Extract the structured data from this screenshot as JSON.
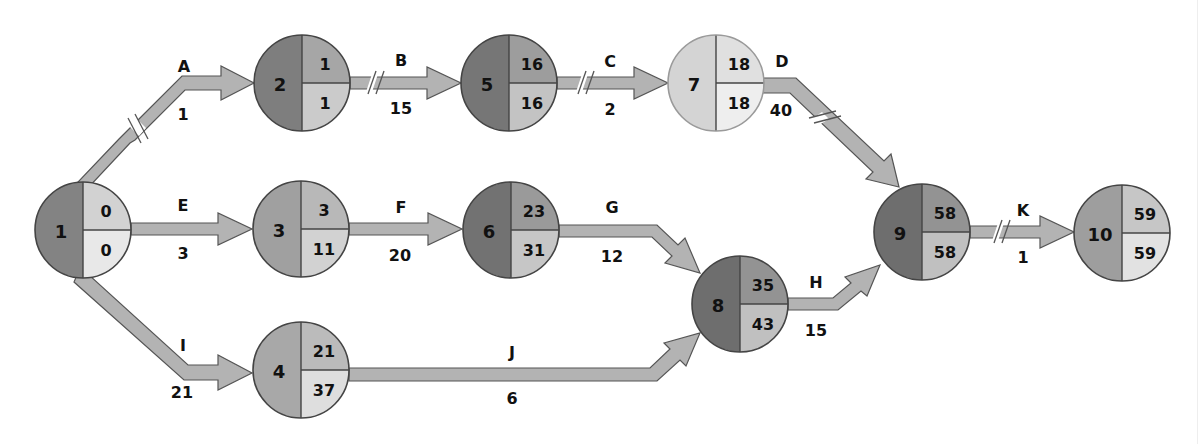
{
  "diagram": {
    "type": "network-diagram",
    "colors": {
      "arrow_fill": "#b3b3b3",
      "arrow_stroke": "#555555",
      "critical_dark": "#777777",
      "medium": "#9c9c9c",
      "light": "#c8c8c8",
      "very_light": "#e4e4e4",
      "background": "#ffffff"
    },
    "nodes": [
      {
        "id": "1",
        "earliest": "0",
        "latest": "0",
        "cx": 83,
        "cy": 230,
        "left": "#838383",
        "topright": "#d2d2d2",
        "bottomright": "#e8e8e8",
        "light_ring": false
      },
      {
        "id": "2",
        "earliest": "1",
        "latest": "1",
        "cx": 302,
        "cy": 83,
        "left": "#7e7e7e",
        "topright": "#a6a6a6",
        "bottomright": "#cbcbcb",
        "light_ring": false
      },
      {
        "id": "3",
        "earliest": "3",
        "latest": "11",
        "cx": 301,
        "cy": 229,
        "left": "#a0a0a0",
        "topright": "#b8b8b8",
        "bottomright": "#d2d2d2",
        "light_ring": false
      },
      {
        "id": "4",
        "earliest": "21",
        "latest": "37",
        "cx": 301,
        "cy": 370,
        "left": "#a8a8a8",
        "topright": "#bbbbbb",
        "bottomright": "#dedede",
        "light_ring": false
      },
      {
        "id": "5",
        "earliest": "16",
        "latest": "16",
        "cx": 509,
        "cy": 83,
        "left": "#767676",
        "topright": "#9d9d9d",
        "bottomright": "#c3c3c3",
        "light_ring": false
      },
      {
        "id": "6",
        "earliest": "23",
        "latest": "31",
        "cx": 511,
        "cy": 230,
        "left": "#727272",
        "topright": "#9a9a9a",
        "bottomright": "#c6c6c6",
        "light_ring": false
      },
      {
        "id": "7",
        "earliest": "18",
        "latest": "18",
        "cx": 716,
        "cy": 83,
        "left": "#d4d4d4",
        "topright": "#e0e0e0",
        "bottomright": "#eeeeee",
        "light_ring": true
      },
      {
        "id": "8",
        "earliest": "35",
        "latest": "43",
        "cx": 740,
        "cy": 304,
        "left": "#6e6e6e",
        "topright": "#939393",
        "bottomright": "#c0c0c0",
        "light_ring": false
      },
      {
        "id": "9",
        "earliest": "58",
        "latest": "58",
        "cx": 922,
        "cy": 232,
        "left": "#6e6e6e",
        "topright": "#939393",
        "bottomright": "#c0c0c0",
        "light_ring": false
      },
      {
        "id": "10",
        "earliest": "59",
        "latest": "59",
        "cx": 1122,
        "cy": 233,
        "left": "#9e9e9e",
        "topright": "#c6c6c6",
        "bottomright": "#e2e2e2",
        "light_ring": false
      }
    ],
    "activities": [
      {
        "name": "A",
        "duration": "1",
        "from": "1",
        "to": "2",
        "critical_break": true
      },
      {
        "name": "B",
        "duration": "15",
        "from": "2",
        "to": "5",
        "critical_break": true
      },
      {
        "name": "C",
        "duration": "2",
        "from": "5",
        "to": "7",
        "critical_break": true
      },
      {
        "name": "D",
        "duration": "40",
        "from": "7",
        "to": "9",
        "critical_break": true
      },
      {
        "name": "E",
        "duration": "3",
        "from": "1",
        "to": "3",
        "critical_break": false
      },
      {
        "name": "F",
        "duration": "20",
        "from": "3",
        "to": "6",
        "critical_break": false
      },
      {
        "name": "G",
        "duration": "12",
        "from": "6",
        "to": "8",
        "critical_break": false
      },
      {
        "name": "H",
        "duration": "15",
        "from": "8",
        "to": "9",
        "critical_break": false
      },
      {
        "name": "I",
        "duration": "21",
        "from": "1",
        "to": "4",
        "critical_break": false
      },
      {
        "name": "J",
        "duration": "6",
        "from": "4",
        "to": "8",
        "critical_break": false
      },
      {
        "name": "K",
        "duration": "1",
        "from": "9",
        "to": "10",
        "critical_break": true
      }
    ]
  }
}
